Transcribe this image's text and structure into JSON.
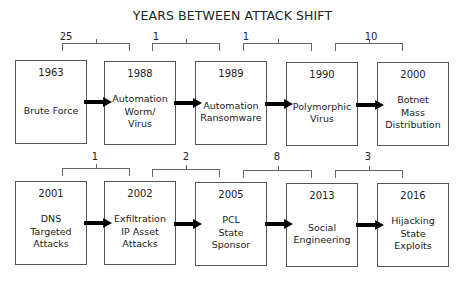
{
  "title": "YEARS BETWEEN ATTACK SHIFT",
  "rows": [
    {
      "boxes": [
        {
          "year": "1963",
          "label": "Brute Force"
        },
        {
          "year": "1988",
          "label": "Automation\nWorm/\nVirus"
        },
        {
          "year": "1989",
          "label": "Automation\nRansomware"
        },
        {
          "year": "1990",
          "label": "Polymorphic\nVirus"
        },
        {
          "year": "2000",
          "label": "Botnet\nMass\nDistribution"
        }
      ],
      "gaps": [
        "25",
        "1",
        "1",
        "10"
      ]
    },
    {
      "boxes": [
        {
          "year": "2001",
          "label": "DNS\nTargeted\nAttacks"
        },
        {
          "year": "2002",
          "label": "Exfiltration\nIP Asset\nAttacks"
        },
        {
          "year": "2005",
          "label": "PCL\nState\nSponsor"
        },
        {
          "year": "2013",
          "label": "Social\nEngineering"
        },
        {
          "year": "2016",
          "label": "Hijacking\nState\nExploits"
        }
      ],
      "gaps": [
        "1",
        "2",
        "8",
        "3"
      ]
    }
  ],
  "colors": {
    "border": "#555555",
    "arrow": "#000000",
    "text": "#222222"
  }
}
